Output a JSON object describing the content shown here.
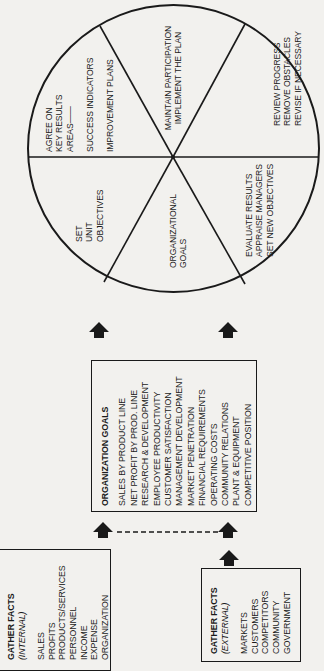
{
  "circle": {
    "segments": [
      {
        "id": "agree",
        "lines": [
          "AGREE ON",
          "KEY RESULTS",
          "AREAS——"
        ]
      },
      {
        "id": "indicators",
        "lines": [
          "SUCCESS INDICATORS"
        ]
      },
      {
        "id": "plans",
        "lines": [
          "IMPROVEMENT PLANS"
        ]
      },
      {
        "id": "maintain",
        "lines": [
          "MAINTAIN PARTICIPATION",
          "IMPLEMENT THE PLAN"
        ]
      },
      {
        "id": "review",
        "lines": [
          "REVIEW PROGRESS",
          "REMOVE OBSTACLES",
          "REVISE IF NECESSARY"
        ]
      },
      {
        "id": "evaluate",
        "lines": [
          "EVALUATE RESULTS",
          "APPRAISE MANAGERS",
          "SET NEW OBJECTIVES"
        ]
      },
      {
        "id": "org_goals",
        "lines": [
          "ORGANIZATIONAL",
          "GOALS"
        ]
      },
      {
        "id": "unit_objectives",
        "lines": [
          "SET",
          "UNIT",
          "OBJECTIVES"
        ]
      }
    ]
  },
  "organization_goals": {
    "title": "ORGANIZATION GOALS",
    "items": [
      "SALES BY PRODUCT LINE",
      "NET PROFIT BY PROD. LINE",
      "RESEARCH & DEVELOPMENT",
      "EMPLOYEE PRODUCTIVITY",
      "CUSTOMER SATISFACTION",
      "MANAGEMENT DEVELOPMENT",
      "MARKET PENETRATION",
      "FINANCIAL REQUIREMENTS",
      "OPERATING COSTS",
      "COMMUNITY RELATIONS",
      "PLANT & EQUIPMENT",
      "COMPETITIVE POSITION"
    ]
  },
  "gather_internal": {
    "title": "GATHER FACTS",
    "subtitle": "(INTERNAL)",
    "items": [
      "SALES",
      "PROFITS",
      "PRODUCTS/SERVICES",
      "PERSONNEL",
      "INCOME",
      "EXPENSE",
      "ORGANIZATION"
    ]
  },
  "gather_external": {
    "title": "GATHER FACTS",
    "subtitle": "(EXTERNAL)",
    "items": [
      "MARKETS",
      "CUSTOMERS",
      "COMPETITORS",
      "COMMUNITY",
      "GOVERNMENT"
    ]
  },
  "colors": {
    "ink": "#1a1a1a",
    "paper": "#f2f1ee"
  }
}
